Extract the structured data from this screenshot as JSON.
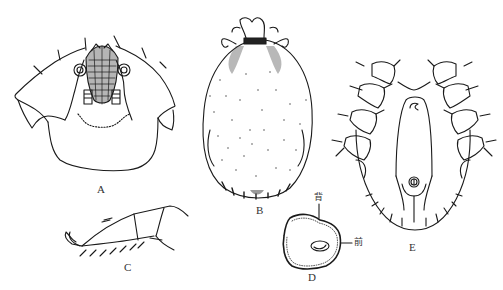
{
  "figure": {
    "panels": [
      {
        "id": "A",
        "label": "A",
        "description": "capitulum and anterior body, dorsal view"
      },
      {
        "id": "B",
        "label": "B",
        "description": "whole body, dorsal view (stippled)"
      },
      {
        "id": "C",
        "label": "C",
        "description": "leg tarsus, lateral view"
      },
      {
        "id": "D",
        "label": "D",
        "description": "spiracular plate"
      },
      {
        "id": "E",
        "label": "E",
        "description": "whole body, ventral view"
      }
    ],
    "annotations": {
      "dorsal": "背",
      "anterior": "前"
    },
    "colors": {
      "line": "#1a1a1a",
      "background": "#ffffff"
    }
  }
}
